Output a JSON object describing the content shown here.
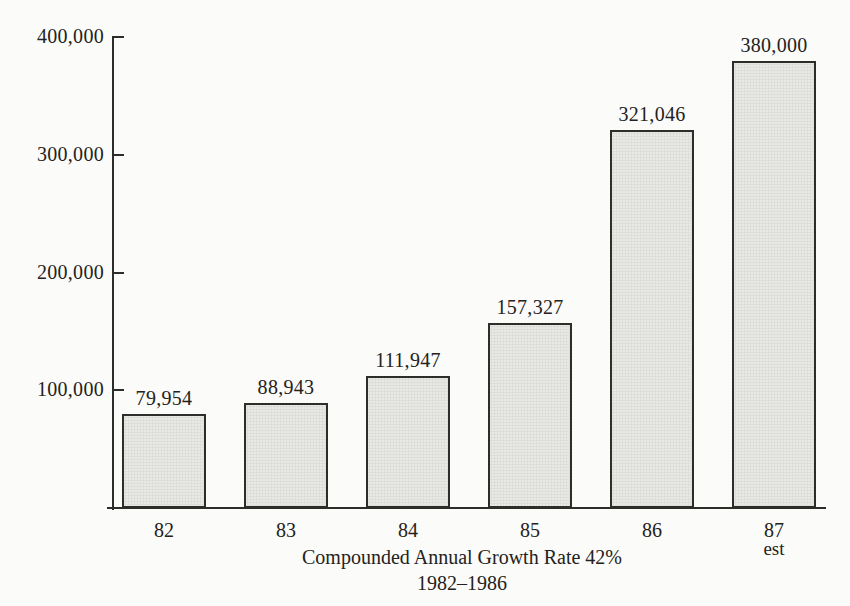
{
  "chart_data": {
    "type": "bar",
    "title": "",
    "categories": [
      "82",
      "83",
      "84",
      "85",
      "86",
      "87"
    ],
    "category_sublabels": [
      "",
      "",
      "",
      "",
      "",
      "est"
    ],
    "values": [
      79954,
      88943,
      111947,
      157327,
      321046,
      380000
    ],
    "value_labels": [
      "79,954",
      "88,943",
      "111,947",
      "157,327",
      "321,046",
      "380,000"
    ],
    "ylim": [
      0,
      400000
    ],
    "yticks": [
      {
        "value": 100000,
        "label": "100,000"
      },
      {
        "value": 200000,
        "label": "200,000"
      },
      {
        "value": 300000,
        "label": "300,000"
      },
      {
        "value": 400000,
        "label": "400,000"
      }
    ],
    "xlabel": "Compounded Annual Growth Rate 42%",
    "xlabel_line2": "1982–1986",
    "grid": false,
    "legend": "none",
    "colors": {
      "background": "#fbfbf9",
      "bar_fill": "#e9e9e6",
      "bar_texture": "rgba(120,120,112,0.10)",
      "bar_border": "#2f2d2a",
      "axis": "#2f2d2a",
      "text": "#242220"
    }
  }
}
